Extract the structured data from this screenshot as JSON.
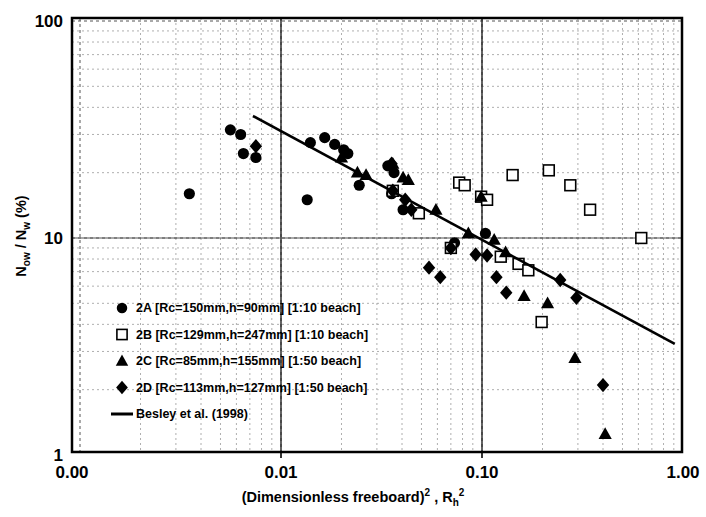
{
  "chart_data": {
    "type": "scatter",
    "title": "",
    "xlabel": "(Dimensionless freeboard)2 , Rh2",
    "xlabel_parts": {
      "main": "(Dimensionless freeboard)",
      "exp1": "2",
      "comma": " , ",
      "sym": "R",
      "subh": "h",
      "exp2": "2"
    },
    "ylabel": "N ow / N w (%)",
    "ylabel_parts": {
      "n1": "N",
      "sub1": "ow",
      "slash": " / ",
      "n2": "N",
      "sub2": "w",
      "unit": " (%)"
    },
    "xscale": "log",
    "yscale": "log",
    "xlim": [
      0.0025,
      1.0
    ],
    "ylim": [
      1,
      100
    ],
    "xticks": [
      0.0025,
      0.01,
      0.1,
      1.0
    ],
    "xticklabels": [
      "0.00",
      "0.01",
      "0.10",
      "1.00"
    ],
    "yticks": [
      1,
      10,
      100
    ],
    "yticklabels": [
      "1",
      "10",
      "100"
    ],
    "grid": "minor-dashed-log",
    "legend_position": "lower-left-inside",
    "series": [
      {
        "name": "2A",
        "label": "2A [Rc=150mm,h=90mm] [1:10 beach]",
        "marker": "filled-circle",
        "color": "#000000",
        "points": [
          [
            0.0035,
            16.0
          ],
          [
            0.0056,
            31.5
          ],
          [
            0.0063,
            30.0
          ],
          [
            0.0065,
            24.5
          ],
          [
            0.0075,
            23.5
          ],
          [
            0.0135,
            15.0
          ],
          [
            0.014,
            27.5
          ],
          [
            0.0165,
            29.0
          ],
          [
            0.0185,
            27.0
          ],
          [
            0.0205,
            25.5
          ],
          [
            0.0215,
            24.5
          ],
          [
            0.0245,
            17.5
          ],
          [
            0.034,
            21.5
          ],
          [
            0.0355,
            16.0
          ],
          [
            0.0365,
            20.0
          ],
          [
            0.0405,
            13.5
          ],
          [
            0.073,
            9.5
          ],
          [
            0.104,
            10.5
          ]
        ]
      },
      {
        "name": "2B",
        "label": "2B [Rc=129mm,h=247mm] [1:10 beach]",
        "marker": "open-square",
        "color": "#000000",
        "points": [
          [
            0.036,
            16.5
          ],
          [
            0.0485,
            13.0
          ],
          [
            0.07,
            9.0
          ],
          [
            0.077,
            18.0
          ],
          [
            0.082,
            17.5
          ],
          [
            0.099,
            15.5
          ],
          [
            0.106,
            15.0
          ],
          [
            0.124,
            8.2
          ],
          [
            0.142,
            19.5
          ],
          [
            0.152,
            7.6
          ],
          [
            0.17,
            7.1
          ],
          [
            0.198,
            4.1
          ],
          [
            0.215,
            20.5
          ],
          [
            0.275,
            17.5
          ],
          [
            0.345,
            13.5
          ],
          [
            0.62,
            10.0
          ]
        ]
      },
      {
        "name": "2C",
        "label": "2C [Rc=85mm,h=155mm] [1:50 beach]",
        "marker": "filled-triangle",
        "color": "#000000",
        "points": [
          [
            0.02,
            23.5
          ],
          [
            0.024,
            20.0
          ],
          [
            0.0265,
            19.5
          ],
          [
            0.036,
            22.0
          ],
          [
            0.0405,
            19.0
          ],
          [
            0.043,
            18.5
          ],
          [
            0.059,
            13.5
          ],
          [
            0.0855,
            10.5
          ],
          [
            0.099,
            15.5
          ],
          [
            0.115,
            9.8
          ],
          [
            0.131,
            8.6
          ],
          [
            0.162,
            5.4
          ],
          [
            0.212,
            5.0
          ],
          [
            0.29,
            2.8
          ],
          [
            0.41,
            1.25
          ]
        ]
      },
      {
        "name": "2D",
        "label": "2D [Rc=113mm,h=127mm] [1:50 beach]",
        "marker": "filled-diamond",
        "color": "#000000",
        "points": [
          [
            0.0075,
            26.5
          ],
          [
            0.0355,
            22.0
          ],
          [
            0.036,
            16.5
          ],
          [
            0.0415,
            15.0
          ],
          [
            0.0445,
            13.5
          ],
          [
            0.0545,
            7.3
          ],
          [
            0.062,
            6.6
          ],
          [
            0.07,
            9.0
          ],
          [
            0.093,
            8.4
          ],
          [
            0.106,
            8.3
          ],
          [
            0.118,
            6.6
          ],
          [
            0.132,
            5.6
          ],
          [
            0.245,
            6.4
          ],
          [
            0.295,
            5.3
          ],
          [
            0.4,
            2.1
          ]
        ]
      }
    ],
    "trendline": {
      "name": "Besley et al. (1998)",
      "label": "Besley et al. (1998)",
      "color": "#000000",
      "x_start": 0.00725,
      "y_start": 36.5,
      "x_end": 0.91,
      "y_end": 3.25
    },
    "legend_entries": [
      {
        "marker": "filled-circle",
        "label": "2A [Rc=150mm,h=90mm] [1:10 beach]"
      },
      {
        "marker": "open-square",
        "label": "2B [Rc=129mm,h=247mm] [1:10 beach]"
      },
      {
        "marker": "filled-triangle",
        "label": "2C [Rc=85mm,h=155mm] [1:50 beach]"
      },
      {
        "marker": "filled-diamond",
        "label": "2D [Rc=113mm,h=127mm] [1:50 beach]"
      },
      {
        "marker": "line",
        "label": "Besley et al. (1998)"
      }
    ]
  }
}
